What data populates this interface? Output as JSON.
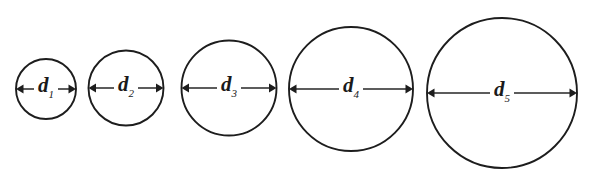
{
  "figure": {
    "background_color": "#ffffff",
    "stroke_color": "#1d1d1d",
    "label_color": "#1a1a1a",
    "width": 590,
    "height": 180,
    "baseline_y": 89
  },
  "chart_data": {
    "type": "diagram",
    "title": "",
    "xlabel": "",
    "ylabel": "",
    "categories": [
      "d1",
      "d2",
      "d3",
      "d4",
      "d5"
    ],
    "values": [
      60,
      75,
      95,
      124,
      150
    ],
    "value_unit": "pixels (rendered diameter)",
    "series": [
      {
        "name": "diameter",
        "values": [
          60,
          75,
          95,
          124,
          150
        ]
      }
    ],
    "shapes": [
      {
        "id": "circle-1",
        "label_base": "d",
        "label_subscript": "1",
        "center_x": 46,
        "center_y": 89,
        "diameter": 60,
        "radius": 30
      },
      {
        "id": "circle-2",
        "label_base": "d",
        "label_subscript": "2",
        "center_x": 126,
        "center_y": 88,
        "diameter": 75,
        "radius": 37.5
      },
      {
        "id": "circle-3",
        "label_base": "d",
        "label_subscript": "3",
        "center_x": 229,
        "center_y": 88,
        "diameter": 95,
        "radius": 47.5
      },
      {
        "id": "circle-4",
        "label_base": "d",
        "label_subscript": "4",
        "center_x": 351,
        "center_y": 89,
        "diameter": 124,
        "radius": 62
      },
      {
        "id": "circle-5",
        "label_base": "d",
        "label_subscript": "5",
        "center_x": 502,
        "center_y": 93,
        "diameter": 150,
        "radius": 75
      }
    ]
  }
}
